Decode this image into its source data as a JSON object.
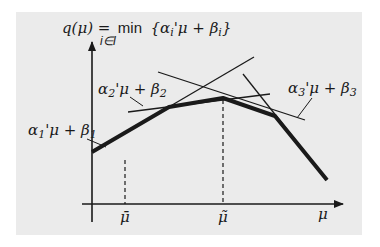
{
  "diagram": {
    "title_formula": {
      "lhs": "q(μ) =",
      "op": "min",
      "subscript": "i∈I",
      "body": "{α",
      "body_sub_i": "i",
      "body_mid": "'μ + β",
      "body_end": "}"
    },
    "line_labels": [
      {
        "alpha": "α",
        "sub": "1",
        "rest": "'μ + β",
        "sub2": "1"
      },
      {
        "alpha": "α",
        "sub": "2",
        "rest": "'μ + β",
        "sub2": "2"
      },
      {
        "alpha": "α",
        "sub": "3",
        "rest": "'μ + β",
        "sub2": "3"
      }
    ],
    "x_axis_label": "μ",
    "tick_labels": [
      "μ̄",
      "μ̃"
    ],
    "colors": {
      "background": "#ebebeb",
      "stroke": "#1a1a1a"
    }
  }
}
